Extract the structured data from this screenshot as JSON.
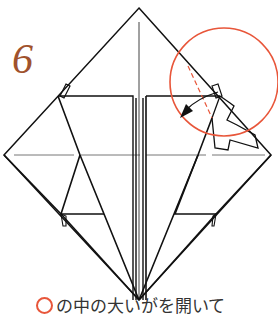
{
  "diagram": {
    "step_number": "6",
    "caption": "の中の大いがを開いて",
    "colors": {
      "line": "#111111",
      "highlight_circle": "#e8563a",
      "step_number": "#a0522d",
      "fold_line": "#888888"
    },
    "annotations": {
      "highlight": "circle-top-right",
      "arrow": "fold-arrow-left",
      "dashed": "valley-fold-line"
    }
  }
}
